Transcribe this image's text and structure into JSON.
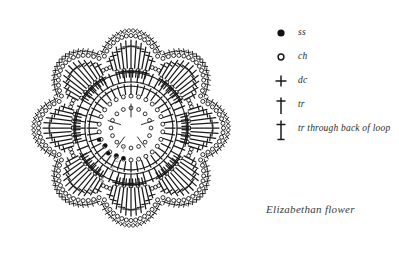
{
  "caption": "Elizabethan flower",
  "colors": {
    "ink": "#1a1a1a",
    "background": "#ffffff",
    "round_number": "#9a9a9a"
  },
  "legend": {
    "items": [
      {
        "symbol": "filled-circle",
        "label": "ss",
        "name": "slip-stitch"
      },
      {
        "symbol": "open-circle",
        "label": "ch",
        "name": "chain"
      },
      {
        "symbol": "plus",
        "label": "dc",
        "name": "double-crochet"
      },
      {
        "symbol": "cross-bar-top",
        "label": "tr",
        "name": "treble"
      },
      {
        "symbol": "cross-bar-top-bottom",
        "label": "tr through back of loop",
        "name": "treble-back-loop"
      }
    ]
  },
  "chart_data": {
    "type": "diagram",
    "title": "Elizabethan flower",
    "subtype": "crochet-stitch-chart",
    "shape": "8-petal round motif",
    "center": {
      "cx": 131,
      "cy": 128
    },
    "rounds": [
      {
        "number": 1,
        "label": "1",
        "radius": 20,
        "stitch": "ch",
        "count": 16,
        "note": "chain ring"
      },
      {
        "number": 2,
        "label": "2",
        "radius": 32,
        "stitch": "ch",
        "count": 26
      },
      {
        "number": 3,
        "label": "3",
        "radius": 44,
        "stitch": "tr",
        "count": 40
      },
      {
        "number": 4,
        "label": "4",
        "radius": 58,
        "stitch": "tr",
        "count": 48
      },
      {
        "number": 5,
        "label": "5",
        "radius": 72,
        "stitch": "dc/ch",
        "count": 56
      }
    ],
    "round_labels": [
      "1",
      "2",
      "3",
      "4",
      "5"
    ],
    "petals": 8,
    "petal_angles_deg": [
      90,
      45,
      0,
      315,
      270,
      225,
      180,
      135
    ],
    "slip_stitch_markers": 5,
    "legend_symbols": [
      "ss",
      "ch",
      "dc",
      "tr",
      "tr through back of loop"
    ]
  }
}
